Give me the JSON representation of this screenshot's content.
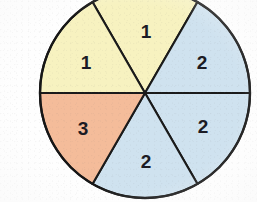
{
  "figure": {
    "background_color": "#ffffff",
    "outline_color": "#161616"
  },
  "chart_data": {
    "type": "pie",
    "title": "",
    "xlabel": "",
    "ylabel": "",
    "legend": "none",
    "grid": false,
    "equal_slices": true,
    "slice_angle_degrees": 60,
    "center_x": 145,
    "center_y": 93,
    "radius": 105,
    "categories": [
      "1",
      "2",
      "2",
      "2",
      "3",
      "1"
    ],
    "values": [
      60,
      60,
      60,
      60,
      60,
      60
    ],
    "labels": [
      "1",
      "2",
      "2",
      "2",
      "3",
      "1"
    ],
    "colors": [
      "#f7f2c0",
      "#cfe2ef",
      "#cfe2ef",
      "#cfe2ef",
      "#f4bc9a",
      "#f7f2c0"
    ],
    "slices": [
      {
        "id": "slice-top",
        "label": "1",
        "color": "#f7f2c0",
        "color_name": "pale-yellow",
        "start_angle": 60,
        "end_angle": 120,
        "label_x": 146,
        "label_y": 31
      },
      {
        "id": "slice-upper-right",
        "label": "2",
        "color": "#cfe2ef",
        "color_name": "light-blue",
        "start_angle": 0,
        "end_angle": 60,
        "label_x": 202,
        "label_y": 62
      },
      {
        "id": "slice-lower-right",
        "label": "2",
        "color": "#cfe2ef",
        "color_name": "light-blue",
        "start_angle": -60,
        "end_angle": 0,
        "label_x": 203,
        "label_y": 126
      },
      {
        "id": "slice-bottom",
        "label": "2",
        "color": "#cfe2ef",
        "color_name": "light-blue",
        "start_angle": -120,
        "end_angle": -60,
        "label_x": 146,
        "label_y": 161
      },
      {
        "id": "slice-lower-left",
        "label": "3",
        "color": "#f4bc9a",
        "color_name": "salmon",
        "start_angle": -180,
        "end_angle": -120,
        "label_x": 83,
        "label_y": 128
      },
      {
        "id": "slice-upper-left",
        "label": "1",
        "color": "#f7f2c0",
        "color_name": "pale-yellow",
        "start_angle": 120,
        "end_angle": 180,
        "label_x": 86,
        "label_y": 62
      }
    ],
    "label_counts": {
      "1": 2,
      "2": 3,
      "3": 1
    }
  }
}
